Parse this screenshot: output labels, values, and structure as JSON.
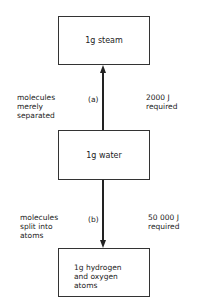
{
  "boxes": {
    "top": "1g steam",
    "middle": "1g water",
    "bottom": "1g hydrogen\nand oxygen\natoms"
  },
  "transitions": {
    "a": {
      "label": "(a)",
      "description": "molecules\nmerely\nseparated",
      "energy": "2000 J\nrequired"
    },
    "b": {
      "label": "(b)",
      "description": "molecules\nsplit into\natoms",
      "energy": "50 000 J\nrequired"
    }
  }
}
